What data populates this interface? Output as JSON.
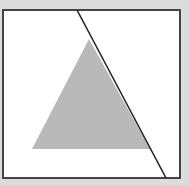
{
  "diagram": {
    "colors": {
      "background": "#dcdcdc",
      "frame_fill": "#ffffff",
      "frame_stroke": "#444444",
      "triangle_fill": "#b9b9b9",
      "line_stroke": "#222222"
    },
    "shapes": [
      {
        "type": "frame",
        "label": "square frame"
      },
      {
        "type": "triangle",
        "label": "filled triangle"
      },
      {
        "type": "line",
        "label": "diagonal line"
      }
    ]
  }
}
